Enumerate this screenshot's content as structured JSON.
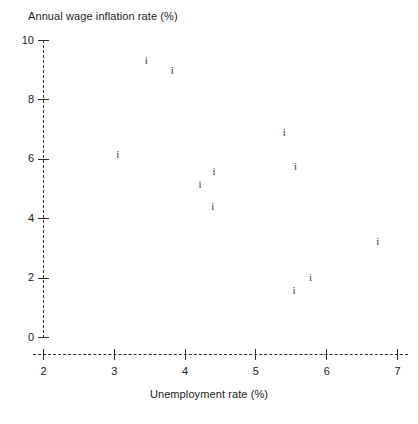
{
  "chart_data": {
    "type": "scatter",
    "title": "",
    "xlabel": "Unemployment rate (%)",
    "ylabel": "Annual wage inflation rate (%)",
    "ylabel_position": "top-left",
    "xlim": [
      1.85,
      7.15
    ],
    "ylim": [
      0,
      10
    ],
    "xticks": [
      2,
      3,
      4,
      5,
      6,
      7
    ],
    "xtick_labels": [
      "2",
      "3",
      "4",
      "5",
      "6",
      "7"
    ],
    "yticks": [
      0,
      2,
      4,
      6,
      8,
      10
    ],
    "ytick_labels": [
      "0",
      "2",
      "4",
      "6",
      "8",
      "10"
    ],
    "grid": false,
    "legend": false,
    "axis_style": "dashed",
    "marker": "i",
    "marker_color": "#3a3a3a",
    "axis_color": "#2b2b2b",
    "background": "#ffffff",
    "points": [
      {
        "x": 3.45,
        "y": 9.3
      },
      {
        "x": 3.82,
        "y": 8.96
      },
      {
        "x": 3.05,
        "y": 6.13
      },
      {
        "x": 5.4,
        "y": 6.87
      },
      {
        "x": 5.56,
        "y": 5.73
      },
      {
        "x": 4.41,
        "y": 5.56
      },
      {
        "x": 4.21,
        "y": 5.15
      },
      {
        "x": 4.39,
        "y": 4.38
      },
      {
        "x": 6.72,
        "y": 3.23
      },
      {
        "x": 5.77,
        "y": 1.99
      },
      {
        "x": 5.54,
        "y": 1.55
      }
    ]
  },
  "geometry": {
    "x_origin_px": 43.5,
    "x_px_per_unit": 70.8,
    "x_origin_value": 2,
    "y_origin_px": 337.5,
    "y_px_per_unit": 29.7,
    "y_origin_value": 0
  }
}
